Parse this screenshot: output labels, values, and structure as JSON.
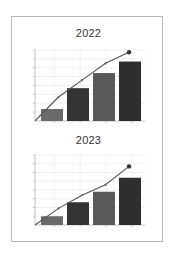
{
  "chart_data": [
    {
      "type": "bar",
      "title": "2022",
      "categories": [
        "1",
        "2",
        "3",
        "4"
      ],
      "series": [
        {
          "name": "bars",
          "type": "bar",
          "values": [
            1.35,
            3.7,
            5.4,
            6.7
          ],
          "colors": [
            "#6a6a6a",
            "#333333",
            "#595959",
            "#2e2e2e"
          ]
        },
        {
          "name": "line",
          "type": "line",
          "x": [
            0,
            1,
            2,
            3,
            4
          ],
          "values": [
            0,
            2.7,
            4.6,
            6.5,
            7.75
          ],
          "color": "#555555"
        }
      ],
      "xlabel": "",
      "ylabel": "",
      "ylim": [
        0,
        8
      ],
      "grid": true,
      "legend": "none"
    },
    {
      "type": "bar",
      "title": "2023",
      "categories": [
        "1",
        "2",
        "3",
        "4"
      ],
      "series": [
        {
          "name": "bars",
          "type": "bar",
          "values": [
            1.0,
            2.6,
            3.8,
            5.4
          ],
          "colors": [
            "#6a6a6a",
            "#333333",
            "#595959",
            "#2e2e2e"
          ]
        },
        {
          "name": "line",
          "type": "line",
          "x": [
            0,
            1,
            2,
            3,
            4
          ],
          "values": [
            0,
            1.9,
            3.4,
            4.6,
            6.7
          ],
          "color": "#555555"
        }
      ],
      "xlabel": "",
      "ylabel": "",
      "ylim": [
        0,
        8
      ],
      "grid": true,
      "legend": "none"
    }
  ],
  "charts": {
    "top": {
      "title": "2022"
    },
    "bottom": {
      "title": "2023"
    }
  }
}
